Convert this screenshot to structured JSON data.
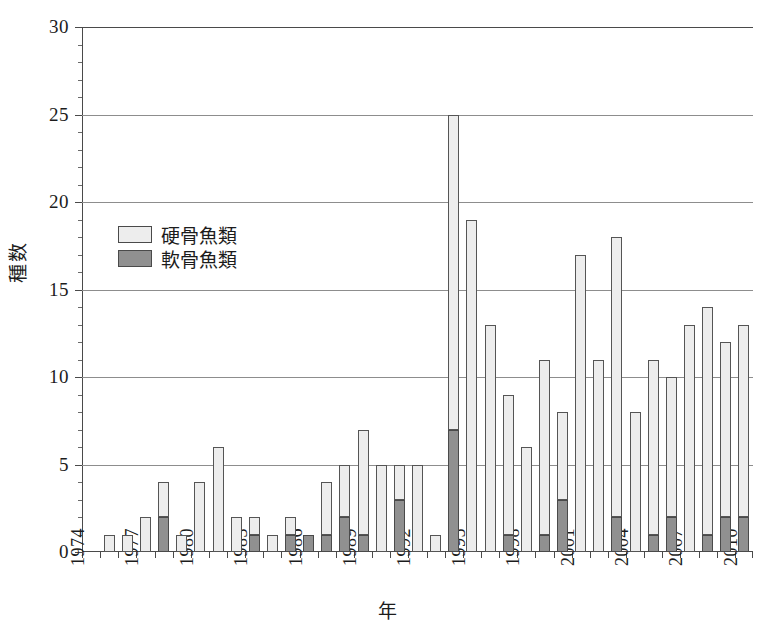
{
  "chart_data": {
    "type": "bar",
    "stacked": true,
    "title": "",
    "xlabel": "年",
    "ylabel": "種数",
    "ylim": [
      0,
      30
    ],
    "ytick_values": [
      0,
      5,
      10,
      15,
      20,
      25,
      30
    ],
    "ytick_labels": [
      "0",
      "5",
      "10",
      "15",
      "20",
      "25",
      "30"
    ],
    "y_minor_tick_step": 1,
    "grid": "horizontal",
    "legend_position": "inside-upper-left",
    "categories": [
      "1974",
      "1975",
      "1976",
      "1977",
      "1978",
      "1979",
      "1980",
      "1981",
      "1982",
      "1983",
      "1984",
      "1985",
      "1986",
      "1987",
      "1988",
      "1989",
      "1990",
      "1991",
      "1992",
      "1993",
      "1994",
      "1995",
      "1996",
      "1997",
      "1998",
      "1999",
      "2000",
      "2001",
      "2002",
      "2003",
      "2004",
      "2005",
      "2006",
      "2007",
      "2008",
      "2009",
      "2010"
    ],
    "xtick_labels_shown": [
      "1974",
      "1977",
      "1980",
      "1983",
      "1986",
      "1989",
      "1992",
      "1995",
      "1998",
      "2001",
      "2004",
      "2007",
      "2010"
    ],
    "xtick_label_rotation": -90,
    "series": [
      {
        "name": "硬骨魚類",
        "color": "#ededed",
        "values": [
          0,
          1,
          1,
          2,
          2,
          1,
          4,
          6,
          2,
          1,
          1,
          1,
          0,
          3,
          3,
          6,
          5,
          2,
          5,
          1,
          18,
          19,
          13,
          8,
          6,
          10,
          5,
          17,
          11,
          16,
          8,
          10,
          8,
          13,
          13,
          10,
          11
        ]
      },
      {
        "name": "軟骨魚類",
        "color": "#909090",
        "values": [
          0,
          0,
          0,
          0,
          2,
          0,
          0,
          0,
          0,
          1,
          0,
          1,
          1,
          1,
          2,
          1,
          0,
          3,
          0,
          0,
          7,
          0,
          0,
          1,
          0,
          1,
          3,
          0,
          0,
          2,
          0,
          1,
          2,
          0,
          1,
          2,
          2
        ]
      }
    ],
    "totals": [
      0,
      1,
      1,
      2,
      4,
      1,
      4,
      6,
      2,
      2,
      1,
      2,
      1,
      4,
      5,
      7,
      5,
      5,
      5,
      1,
      25,
      19,
      13,
      9,
      6,
      11,
      8,
      17,
      11,
      18,
      8,
      11,
      10,
      13,
      14,
      12,
      13
    ]
  },
  "legend": {
    "items": [
      {
        "label": "硬骨魚類",
        "swatch": "bony"
      },
      {
        "label": "軟骨魚類",
        "swatch": "carti"
      }
    ]
  },
  "axes": {
    "y_title": "種数",
    "x_title": "年"
  }
}
